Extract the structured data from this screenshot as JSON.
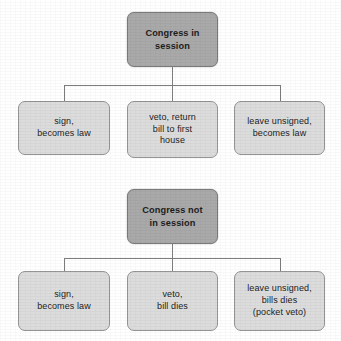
{
  "diagram": {
    "type": "flowchart",
    "background_color": "#ffffff",
    "root_fill_color": "#a9a9a9",
    "leaf_fill_color": "#dcdcdc",
    "border_color": "#8d8d8d",
    "connector_color": "#7d7d7d",
    "text_color": "#1d1d1d",
    "sections": [
      {
        "id": "congress-in-session",
        "root": {
          "label": "Congress in\nsession",
          "x": 127,
          "y": 12,
          "width": 91,
          "height": 55
        },
        "leaves": [
          {
            "id": "sign-becomes-law",
            "label": "sign,\nbecomes law",
            "x": 18,
            "y": 101,
            "width": 92,
            "height": 54
          },
          {
            "id": "veto-return-bill",
            "label": "veto, return\nbill to first\nhouse",
            "x": 127,
            "y": 101,
            "width": 91,
            "height": 57
          },
          {
            "id": "leave-unsigned-becomes-law",
            "label": "leave unsigned,\nbecomes law",
            "x": 234,
            "y": 101,
            "width": 91,
            "height": 54
          }
        ],
        "connector": {
          "stem_top": 67,
          "bar_y": 85,
          "drop_bottom": 101,
          "stem_x": 172,
          "branch_x": [
            64,
            172,
            280
          ]
        }
      },
      {
        "id": "congress-not-in-session",
        "root": {
          "label": "Congress not\nin session",
          "x": 127,
          "y": 189,
          "width": 91,
          "height": 55
        },
        "leaves": [
          {
            "id": "sign-becomes-law-2",
            "label": "sign,\nbecomes law",
            "x": 18,
            "y": 271,
            "width": 92,
            "height": 60
          },
          {
            "id": "veto-bill-dies",
            "label": "veto,\nbill dies",
            "x": 127,
            "y": 271,
            "width": 91,
            "height": 60
          },
          {
            "id": "leave-unsigned-pocket-veto",
            "label": "leave unsigned,\nbills dies\n(pocket veto)",
            "x": 234,
            "y": 271,
            "width": 91,
            "height": 60
          }
        ],
        "connector": {
          "stem_top": 244,
          "bar_y": 258,
          "drop_bottom": 271,
          "stem_x": 172,
          "branch_x": [
            64,
            172,
            280
          ]
        }
      }
    ]
  }
}
